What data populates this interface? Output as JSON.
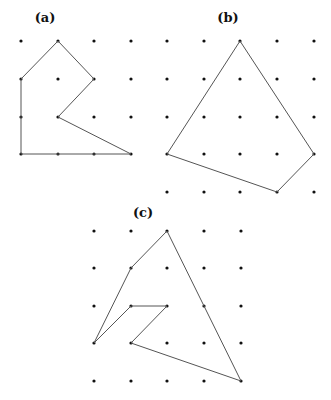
{
  "figure": {
    "width": 331,
    "height": 400,
    "dot_color": "#111111",
    "line_color": "#555555",
    "panels": [
      {
        "label": "(a)",
        "label_pos": [
          45,
          22
        ],
        "grid_x": [
          21,
          58,
          94,
          131
        ],
        "grid_y": [
          41,
          79,
          117,
          154
        ],
        "polygon": [
          [
            58,
            41
          ],
          [
            94,
            79
          ],
          [
            58,
            117
          ],
          [
            131,
            154
          ],
          [
            21,
            154
          ],
          [
            21,
            79
          ]
        ]
      },
      {
        "label": "(b)",
        "label_pos": [
          228,
          22
        ],
        "grid_x": [
          167,
          204,
          240,
          277,
          314
        ],
        "grid_y": [
          41,
          79,
          117,
          154,
          192
        ],
        "polygon": [
          [
            240,
            41
          ],
          [
            314,
            154
          ],
          [
            277,
            192
          ],
          [
            167,
            154
          ]
        ]
      },
      {
        "label": "(c)",
        "label_pos": [
          143,
          217
        ],
        "grid_x": [
          94,
          131,
          167,
          204,
          241
        ],
        "grid_y": [
          231,
          268,
          306,
          343,
          381
        ],
        "polygon": [
          [
            167,
            231
          ],
          [
            241,
            381
          ],
          [
            131,
            343
          ],
          [
            167,
            306
          ],
          [
            131,
            306
          ],
          [
            94,
            343
          ],
          [
            131,
            268
          ]
        ]
      }
    ]
  }
}
